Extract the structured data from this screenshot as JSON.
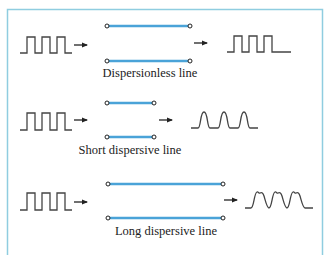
{
  "figure": {
    "colors": {
      "frame": "#8fcde0",
      "line": "#4aa3d8",
      "waveform": "#444444",
      "terminal_fill": "#ffffff",
      "terminal_stroke": "#222222",
      "text": "#222222"
    },
    "panels": [
      {
        "id": "dispersionless",
        "label": "Dispersionless line",
        "input_signal": "square-pulse-train",
        "output_signal": "square-pulse-train",
        "line_length": "medium"
      },
      {
        "id": "short-dispersive",
        "label": "Short dispersive line",
        "input_signal": "square-pulse-train",
        "output_signal": "rounded-pulse-train",
        "line_length": "short"
      },
      {
        "id": "long-dispersive",
        "label": "Long dispersive line",
        "input_signal": "square-pulse-train",
        "output_signal": "distorted-overlapping-pulse-train",
        "line_length": "long"
      }
    ]
  }
}
